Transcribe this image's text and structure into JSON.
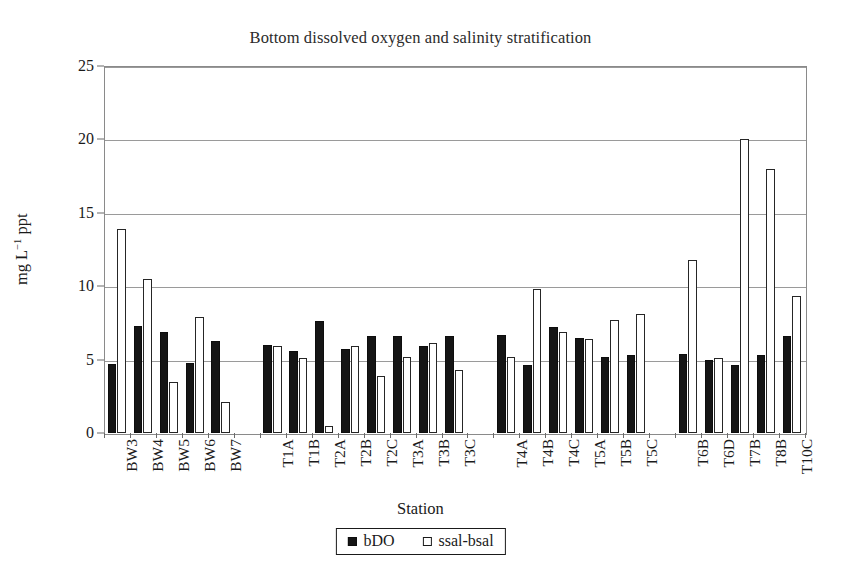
{
  "chart_data": {
    "type": "bar",
    "title": "Bottom dissolved oxygen and salinity stratification",
    "xlabel": "Station",
    "ylabel": "mg L⁻¹ ppt",
    "ylim": [
      0,
      25
    ],
    "ytick_step": 5,
    "yticks": [
      0,
      5,
      10,
      15,
      20,
      25
    ],
    "ytick_labels": [
      "0",
      "5",
      "10",
      "15",
      "20",
      "25"
    ],
    "grid": "horizontal",
    "legend_position": "bottom-center",
    "categories": [
      "BW3",
      "BW4",
      "BW5",
      "BW6",
      "BW7",
      "T1A",
      "T1B",
      "T2A",
      "T2B",
      "T2C",
      "T3A",
      "T3B",
      "T3C",
      "T4A",
      "T4B",
      "T4C",
      "T5A",
      "T5B",
      "T5C",
      "T6B",
      "T6D",
      "T7B",
      "T8B",
      "T10C"
    ],
    "group_breaks_after": [
      "BW7",
      "T3C",
      "T5C"
    ],
    "series": [
      {
        "name": "bDO",
        "color": "#151515",
        "style": "filled",
        "values": [
          4.7,
          7.3,
          6.9,
          4.8,
          6.3,
          6.0,
          5.6,
          7.6,
          5.7,
          6.6,
          6.6,
          5.9,
          6.6,
          6.7,
          4.6,
          7.2,
          6.5,
          5.2,
          5.3,
          5.4,
          5.0,
          4.6,
          5.3,
          6.6
        ]
      },
      {
        "name": "ssal-bsal",
        "color": "#ffffff",
        "style": "open",
        "values": [
          13.9,
          10.5,
          3.5,
          7.9,
          2.1,
          5.9,
          5.1,
          0.5,
          5.9,
          3.9,
          5.2,
          6.1,
          4.3,
          5.2,
          9.8,
          6.9,
          6.4,
          7.7,
          8.1,
          11.8,
          5.1,
          20.0,
          18.0,
          9.3
        ]
      }
    ]
  },
  "legend": {
    "items": [
      {
        "label": "bDO",
        "swatch": "filled-square"
      },
      {
        "label": "ssal-bsal",
        "swatch": "open-square"
      }
    ]
  }
}
